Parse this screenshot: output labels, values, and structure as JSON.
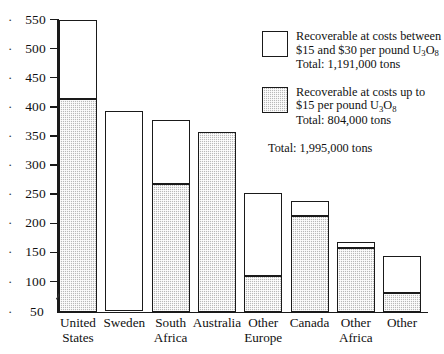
{
  "chart_data": {
    "type": "bar",
    "title": "",
    "subtitle": "",
    "xlabel": "",
    "ylabel": "",
    "stacked": true,
    "grid": false,
    "legend_position": "top-right",
    "axis_break": true,
    "axis_break_between": [
      50,
      100
    ],
    "ylim": [
      50,
      550
    ],
    "ytick_labels": [
      "550",
      "500",
      "450",
      "400",
      "350",
      "300",
      "250",
      "200",
      "150",
      "100",
      "50"
    ],
    "ytick_values": [
      550,
      500,
      450,
      400,
      350,
      300,
      250,
      200,
      150,
      100,
      50
    ],
    "categories": [
      "United States",
      "Sweden",
      "South Africa",
      "Australia",
      "Other Europe",
      "Canada",
      "Other Africa",
      "Other"
    ],
    "category_lines": [
      [
        "United",
        "States"
      ],
      [
        "Sweden",
        ""
      ],
      [
        "South",
        "Africa"
      ],
      [
        "Australia",
        ""
      ],
      [
        "Other",
        "Europe"
      ],
      [
        "Canada",
        ""
      ],
      [
        "Other",
        "Africa"
      ],
      [
        "Other",
        ""
      ]
    ],
    "series": [
      {
        "name": "Recoverable at costs up to $15 per pound U3O8",
        "fill": "gray-hatch",
        "values": [
          413,
          0,
          268,
          357,
          110,
          212,
          157,
          80
        ]
      },
      {
        "name": "Recoverable at costs between $15 and $30 per pound U3O8",
        "fill": "white",
        "values": [
          137,
          392,
          110,
          0,
          142,
          26,
          10,
          63
        ]
      }
    ],
    "totals": [
      550,
      392,
      378,
      357,
      252,
      238,
      167,
      143
    ],
    "units": "thousand short tons U3O8"
  },
  "legend": {
    "items": [
      {
        "swatch": "white",
        "lines": [
          "Recoverable at costs between",
          "$15 and $30 per pound U₃O₈",
          "Total: 1,191,000 tons"
        ],
        "line1": "Recoverable at costs between",
        "line2_pre": "$15 and $30 per pound U",
        "line2_sub1": "3",
        "line2_mid": "O",
        "line2_sub2": "8",
        "line3": "Total: 1,191,000 tons"
      },
      {
        "swatch": "gray",
        "lines": [
          "Recoverable at costs up to",
          "$15 per pound U₃O₈",
          "Total: 804,000 tons"
        ],
        "line1": "Recoverable at costs up to",
        "line2_pre": "$15 per pound U",
        "line2_sub1": "3",
        "line2_mid": "O",
        "line2_sub2": "8",
        "line3": "Total: 804,000 tons"
      }
    ],
    "grand_total": "Total: 1,995,000 tons"
  },
  "colors": {
    "axis": "#1a1a1a",
    "bar_outline": "#1a1a1a",
    "lower_fill": "#b9b9b9",
    "upper_fill": "#ffffff",
    "background": "#ffffff",
    "text": "#111111"
  }
}
